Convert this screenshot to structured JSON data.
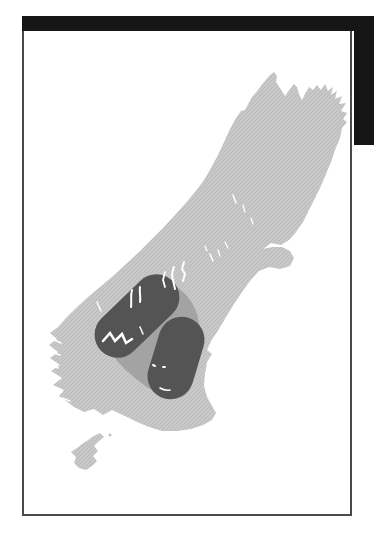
{
  "page": {
    "background_color": "#ffffff"
  },
  "decor": {
    "top_bar_color": "#161616",
    "right_block_color": "#161616",
    "frame_border_color": "#4a4a4a"
  },
  "map": {
    "description": "distribution-map-south-island-new-zealand",
    "sea_color": "#ffffff",
    "land_base_color": "#c8c8c8",
    "land_hatch_color": "#b9b9b9",
    "range_halo_color": "#a3a3a3",
    "range_core_color": "#545454",
    "water_mark_color": "#ffffff",
    "islet_color": "#c4c4c4",
    "south_island_path": "M245,110 L252,97 L258,90 L264,82 L270,75 L274,72 L277,76 L276,82 L280,88 L285,96 L290,89 L294,84 L297,87 L299,94 L302,100 L306,92 L309,87 L313,90 L317,85 L321,90 L325,84 L328,91 L333,87 L331,95 L337,91 L335,99 L342,96 L339,104 L346,103 L341,111 L347,113 L343,119 L347,122 L342,128 L340,138 L335,150 L331,162 L326,174 L321,186 L315,198 L309,210 L303,222 L296,232 L289,240 L281,245 L271,243 L263,249 L272,247 L282,247 L290,251 L294,258 L290,266 L280,269 L269,267 L259,271 L250,281 L242,292 L234,304 L226,317 L219,329 L211,341 L207,350 L212,354 L207,362 L205,374 L204,386 L207,397 L212,406 L216,413 L212,420 L203,425 L191,429 L177,431 L162,431 L149,427 L137,422 L125,416 L112,410 L103,415 L94,409 L84,412 L74,407 L66,401 L59,396 L64,390 L53,385 L62,378 L51,371 L60,365 L50,358 L58,352 L49,345 L57,339 L50,333 L58,327 L66,318 L76,308 L88,297 L100,287 L113,276 L126,264 L139,252 L151,240 L163,228 L174,216 L185,204 L195,192 L204,180 L211,168 L218,155 L224,142 L230,129 L236,118 L241,111 Z",
    "stewart_island_path": "M100,433 L104,437 L99,441 L94,446 L98,451 L93,456 L97,461 L92,466 L86,470 L79,468 L74,463 L76,457 L71,452 L77,448 L82,444 L87,441 L92,437 Z",
    "islet": {
      "cx": 110,
      "cy": 435,
      "r": 1.5
    },
    "halo_path": "M162,283 C178,283 193,298 198,318 C202,336 202,364 190,389 C185,399 172,401 160,395 C141,385 119,366 109,350 C101,337 104,321 114,309 C126,296 146,283 162,283 Z",
    "range_zones": [
      {
        "x": 87,
        "y": 293,
        "w": 100,
        "h": 46,
        "rx": 23,
        "transform": "rotate(-44 137 316)"
      },
      {
        "x": 134,
        "y": 335,
        "w": 84,
        "h": 46,
        "rx": 23,
        "transform": "rotate(-73 176 358)"
      }
    ],
    "water_marks": [
      {
        "d": "M184,262 l-2,7 l3,5 l-2,7",
        "w": 2
      },
      {
        "d": "M174,267 q-3,7 -1,13 l2,9",
        "w": 2
      },
      {
        "d": "M165,272 l-2,8 l2,7",
        "w": 1.8
      },
      {
        "d": "M140,287 c-1,5 1,9 0,15",
        "w": 2
      },
      {
        "d": "M132,290 c-2,6 0,11 -1,17",
        "w": 2
      },
      {
        "d": "M103,341 l7,-8 l5,8 l7,-7 l4,9 l6,-4",
        "w": 2.5
      },
      {
        "d": "M140,327 l3,7",
        "w": 1.5
      },
      {
        "d": "M153,365 l2,1",
        "w": 2
      },
      {
        "d": "M163,367 l2,0",
        "w": 1.8
      },
      {
        "d": "M160,388 q5,3 10,2",
        "w": 1.6
      },
      {
        "d": "M210,254 l3,7",
        "w": 1.5
      },
      {
        "d": "M218,250 l2,6",
        "w": 1.3
      },
      {
        "d": "M233,195 l3,8",
        "w": 1.5
      },
      {
        "d": "M243,205 l2,7",
        "w": 1.3
      },
      {
        "d": "M251,218 l2,6",
        "w": 1.3
      },
      {
        "d": "M225,242 l3,6",
        "w": 1.3
      },
      {
        "d": "M205,246 l2,5",
        "w": 1.2
      },
      {
        "d": "M97,302 l4,9",
        "w": 1.5
      },
      {
        "d": "M52,339 l9,4",
        "w": 1.6
      },
      {
        "d": "M50,352 l10,3",
        "w": 1.6
      },
      {
        "d": "M49,364 l9,4",
        "w": 1.6
      },
      {
        "d": "M51,376 l9,3",
        "w": 1.6
      },
      {
        "d": "M54,388 l8,4",
        "w": 1.6
      },
      {
        "d": "M62,398 l8,3",
        "w": 1.6
      }
    ]
  }
}
